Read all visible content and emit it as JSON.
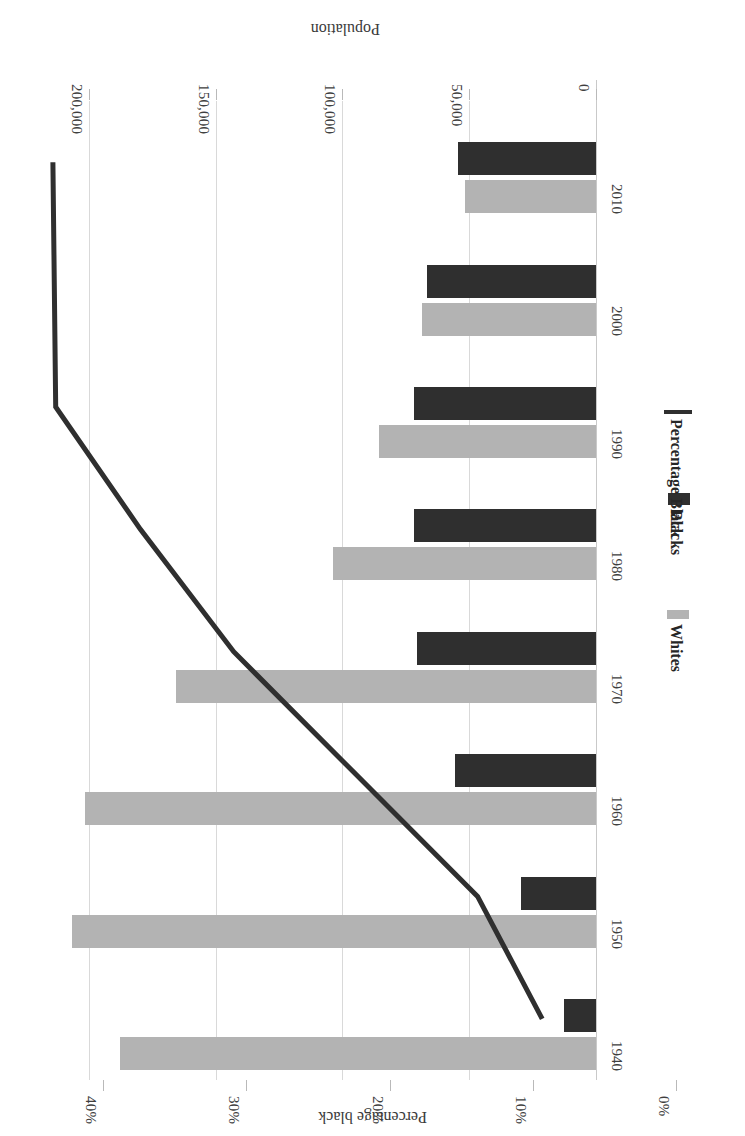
{
  "chart_data": {
    "type": "bar",
    "title": "",
    "categories": [
      "1940",
      "1950",
      "1960",
      "1970",
      "1980",
      "1990",
      "2000",
      "2010"
    ],
    "xlabel": "",
    "ylabel": "Population",
    "y2label": "Percentage black",
    "ylim": [
      0,
      220000
    ],
    "y2lim": [
      0,
      44
    ],
    "grid": true,
    "legend_position": "bottom",
    "series": [
      {
        "name": "Whites",
        "type": "bar",
        "color": "#b3b3b3",
        "values": [
          188000,
          207000,
          202000,
          166000,
          104000,
          86000,
          69000,
          52000
        ]
      },
      {
        "name": "Blacks",
        "type": "bar",
        "color": "#2f2f2f",
        "values": [
          13000,
          30000,
          56000,
          71000,
          72000,
          72000,
          67000,
          55000
        ]
      },
      {
        "name": "Percentage Black",
        "type": "line",
        "color": "#2f2f2f",
        "axis": "secondary",
        "unit": "%",
        "values": [
          8.0,
          12.5,
          21.0,
          29.5,
          36.0,
          41.9,
          42.0,
          42.1
        ]
      }
    ],
    "y_ticks": [
      {
        "label": "0",
        "value": 0
      },
      {
        "label": "50,000",
        "value": 50000
      },
      {
        "label": "100,000",
        "value": 100000
      },
      {
        "label": "150,000",
        "value": 150000
      },
      {
        "label": "200,000",
        "value": 200000
      }
    ],
    "y2_ticks": [
      {
        "label": "0%",
        "value": 0
      },
      {
        "label": "10%",
        "value": 10
      },
      {
        "label": "20%",
        "value": 20
      },
      {
        "label": "30%",
        "value": 30
      },
      {
        "label": "40%",
        "value": 40
      }
    ]
  },
  "axes": {
    "population_title": "Population",
    "percentage_title": "Percentage black"
  },
  "legend": {
    "items": [
      {
        "label": "Whites",
        "marker": "whites"
      },
      {
        "label": "Blacks",
        "marker": "blacks"
      },
      {
        "label": "Percentage Black",
        "marker": "line"
      }
    ]
  }
}
